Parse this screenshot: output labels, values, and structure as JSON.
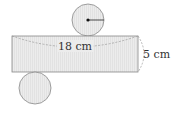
{
  "diagram": {
    "type": "cylinder-net",
    "colors": {
      "fill": "#ebebeb",
      "stroke": "#888888",
      "dash": "#9a9a9a",
      "text": "#333333",
      "center_dot": "#111111"
    },
    "rectangle": {
      "x": 12,
      "y": 36,
      "width": 126,
      "height": 36,
      "length_label": "18 cm",
      "height_label": "5 cm"
    },
    "top_circle": {
      "cx": 88,
      "cy": 20,
      "r": 16,
      "has_radius": true
    },
    "bottom_circle": {
      "cx": 35,
      "cy": 88,
      "r": 16,
      "has_radius": false
    }
  }
}
